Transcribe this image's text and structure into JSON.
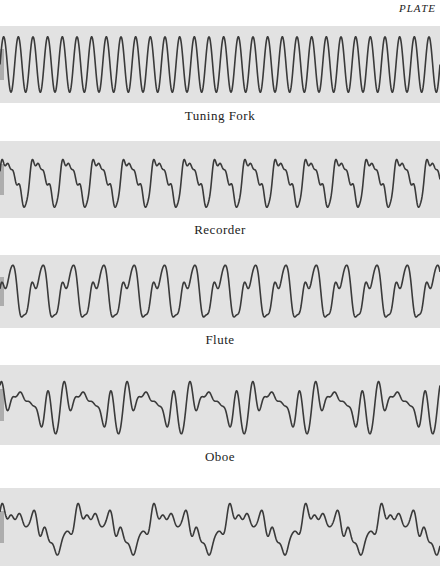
{
  "header": {
    "plate_label": "PLATE"
  },
  "strips": [
    {
      "id": "tuning-fork",
      "caption": "Tuning Fork",
      "top": 26,
      "height": 77,
      "caption_top": 108,
      "cycles": 30,
      "shape": "sine"
    },
    {
      "id": "recorder",
      "caption": "Recorder",
      "top": 141,
      "height": 77,
      "caption_top": 222,
      "cycles": 14.5,
      "shape": "recorder"
    },
    {
      "id": "flute",
      "caption": "Flute",
      "top": 255,
      "height": 73,
      "caption_top": 332,
      "cycles": 14.5,
      "shape": "flute"
    },
    {
      "id": "oboe",
      "caption": "Oboe",
      "top": 365,
      "height": 80,
      "caption_top": 449,
      "cycles": 7,
      "shape": "oboe"
    },
    {
      "id": "unlabeled",
      "caption": "",
      "top": 488,
      "height": 78,
      "caption_top": 571,
      "cycles": 5.8,
      "shape": "complex"
    }
  ],
  "colors": {
    "paper": "#e2e2e2",
    "trace": "#3a3a3a",
    "background": "#ffffff"
  }
}
